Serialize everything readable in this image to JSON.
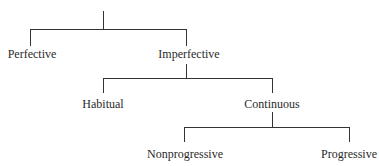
{
  "diagram": {
    "type": "tree",
    "nodes": {
      "perfective": "Perfective",
      "imperfective": "Imperfective",
      "habitual": "Habitual",
      "continuous": "Continuous",
      "nonprogressive": "Nonprogressive",
      "progressive": "Progressive"
    },
    "edges": [
      [
        "root",
        "Perfective"
      ],
      [
        "root",
        "Imperfective"
      ],
      [
        "Imperfective",
        "Habitual"
      ],
      [
        "Imperfective",
        "Continuous"
      ],
      [
        "Continuous",
        "Nonprogressive"
      ],
      [
        "Continuous",
        "Progressive"
      ]
    ]
  }
}
